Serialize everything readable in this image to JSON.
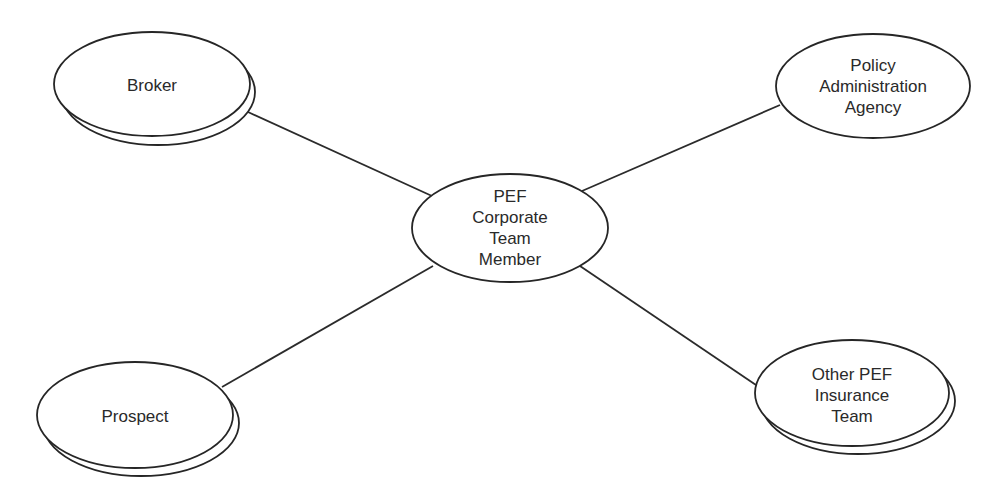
{
  "diagram": {
    "type": "context-diagram",
    "center": {
      "id": "center",
      "lines": [
        "PEF",
        "Corporate",
        "Team",
        "Member"
      ]
    },
    "nodes": [
      {
        "id": "broker",
        "lines": [
          "Broker"
        ]
      },
      {
        "id": "policy",
        "lines": [
          "Policy",
          "Administration",
          "Agency"
        ]
      },
      {
        "id": "prospect",
        "lines": [
          "Prospect"
        ]
      },
      {
        "id": "other",
        "lines": [
          "Other PEF",
          "Insurance",
          "Team"
        ]
      }
    ],
    "edges": [
      {
        "from": "broker",
        "to": "center"
      },
      {
        "from": "policy",
        "to": "center"
      },
      {
        "from": "prospect",
        "to": "center"
      },
      {
        "from": "other",
        "to": "center"
      }
    ],
    "colors": {
      "line": "#262626",
      "fill": "#ffffff",
      "text": "#2a2a2a"
    }
  }
}
